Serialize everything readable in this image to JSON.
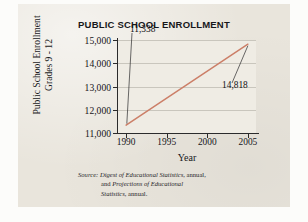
{
  "chart_data": {
    "type": "line",
    "title": "PUBLIC SCHOOL ENROLLMENT",
    "xlabel": "Year",
    "ylabel": "Public School Enrollment Grades 9 - 12",
    "ylabel_line1": "Public School Enrollment",
    "ylabel_line2": "Grades 9 - 12",
    "x": [
      1990,
      2005
    ],
    "values": [
      11338,
      14818
    ],
    "xlim": [
      1989,
      2006
    ],
    "ylim": [
      11000,
      15000
    ],
    "xticks": [
      "1990",
      "1995",
      "2000",
      "2005"
    ],
    "xtick_values": [
      1990,
      1995,
      2000,
      2005
    ],
    "yticks": [
      "11,000",
      "12,000",
      "13,000",
      "14,000",
      "15,000"
    ],
    "ytick_values": [
      11000,
      12000,
      13000,
      14000,
      15000
    ],
    "grid": "horizontal",
    "legend": "none",
    "line_color": "#cc7f68",
    "annotations": [
      {
        "label": "11,338",
        "x": 1990,
        "y": 11338
      },
      {
        "label": "14,818",
        "x": 2005,
        "y": 14818
      }
    ]
  },
  "source": {
    "label": "Source:",
    "line1_rest_italic": "Digest of Educational Statistics",
    "line1_tail": ", annual,",
    "line2_lead": "and ",
    "line2_italic": "Projections of Educational",
    "line3_italic": "Statistics",
    "line3_tail": ", annual."
  },
  "colors": {
    "paper": "#e9e5dc",
    "plot_background": "#efece4",
    "axis": "#2b2b2c",
    "gridline": "#c9c6bd",
    "series": "#cc7f68",
    "text": "#16161a"
  }
}
